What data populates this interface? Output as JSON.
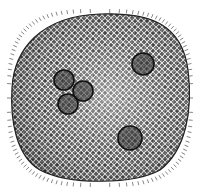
{
  "image": {
    "subject": "Spherical single-celled organism illustration with reticulate surface and marginal spines",
    "background": "#ffffff",
    "body_fill_dark": "#3a3a3a",
    "body_fill_light": "#bdbdbd",
    "mesh_color": "#f2f2f2",
    "spine_color": "#555555",
    "inclusions": [
      {
        "name": "inclusion-cluster-a",
        "cx": 64,
        "cy": 80,
        "r": 10
      },
      {
        "name": "inclusion-cluster-b",
        "cx": 83,
        "cy": 91,
        "r": 10
      },
      {
        "name": "inclusion-cluster-c",
        "cx": 68,
        "cy": 104,
        "r": 10
      },
      {
        "name": "inclusion-upper-right",
        "cx": 143,
        "cy": 64,
        "r": 11
      },
      {
        "name": "inclusion-lower-right",
        "cx": 130,
        "cy": 138,
        "r": 12
      }
    ]
  }
}
